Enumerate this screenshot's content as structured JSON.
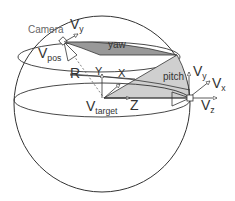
{
  "diagram": {
    "type": "spherical-camera-model",
    "colors": {
      "line": "#333333",
      "yaw_fill": "#999999",
      "pitch_fill": "#cfcfcf",
      "label": "#444444",
      "camera_label": "#666666"
    },
    "labels": {
      "camera": "Camera",
      "camera_vy_main": "V",
      "camera_vy_sub": "y",
      "vpos_main": "V",
      "vpos_sub": "pos",
      "yaw": "yaw",
      "pitch": "pitch",
      "radius": "R",
      "axis_y": "Y",
      "axis_x": "X",
      "axis_z": "Z",
      "vtarget_main": "V",
      "vtarget_sub": "target",
      "right_vy_main": "V",
      "right_vy_sub": "y",
      "right_vx_main": "V",
      "right_vx_sub": "x",
      "right_vz_main": "V",
      "right_vz_sub": "z"
    }
  }
}
